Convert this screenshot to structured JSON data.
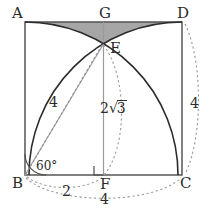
{
  "figure": {
    "type": "geometry-diagram",
    "colors": {
      "stroke": "#2b2b2b",
      "light_stroke": "#8c8c8c",
      "dotted": "#9a9a9a",
      "shade_fill": "#9e9e9e",
      "background": "#ffffff"
    },
    "square": {
      "vertices": [
        {
          "name": "A",
          "label": "A",
          "x": 25,
          "y": 22,
          "label_x": 12,
          "label_y": 6
        },
        {
          "name": "D",
          "label": "D",
          "x": 182,
          "y": 22,
          "label_x": 177,
          "label_y": 6
        },
        {
          "name": "C",
          "label": "C",
          "x": 182,
          "y": 175,
          "label_x": 180,
          "label_y": 176
        },
        {
          "name": "B",
          "label": "B",
          "x": 25,
          "y": 175,
          "label_x": 12,
          "label_y": 176
        }
      ],
      "side_length": 4
    },
    "points": [
      {
        "name": "G",
        "label": "G",
        "x": 103.5,
        "y": 22,
        "label_x": 99,
        "label_y": 6,
        "role": "midpoint-of-AD"
      },
      {
        "name": "F",
        "label": "F",
        "x": 103.5,
        "y": 175,
        "label_x": 100,
        "label_y": 177,
        "role": "midpoint-of-BC"
      },
      {
        "name": "E",
        "label": "E",
        "x": 103.5,
        "y": 44,
        "label_x": 110,
        "label_y": 41,
        "role": "arc-intersection"
      }
    ],
    "measures": [
      {
        "name": "left-radius",
        "label": "4",
        "x": 49,
        "y": 95,
        "target": "BE-radius"
      },
      {
        "name": "right-side",
        "label": "4",
        "x": 190,
        "y": 96,
        "target": "DC-side"
      },
      {
        "name": "height-EF",
        "label": "2√3",
        "base": "2",
        "radicand": "3",
        "x": 100,
        "y": 100,
        "target": "EF-height"
      },
      {
        "name": "half-base",
        "label": "2",
        "x": 62,
        "y": 184,
        "target": "BF-segment"
      },
      {
        "name": "full-base",
        "label": "4",
        "x": 100,
        "y": 192,
        "target": "BC-segment"
      },
      {
        "name": "angle-EBF",
        "label": "60°",
        "x": 36,
        "y": 160,
        "target": "angle-at-B"
      }
    ],
    "arcs": [
      {
        "name": "arc-from-B",
        "center": "B",
        "radius": 4,
        "style": "solid",
        "from": "A",
        "to": "C-side"
      },
      {
        "name": "arc-from-C",
        "center": "C",
        "radius": 4,
        "style": "solid",
        "from": "D",
        "to": "B-side"
      },
      {
        "name": "dimension-arc-BF",
        "style": "dotted",
        "label": "2"
      },
      {
        "name": "dimension-arc-BC",
        "style": "dotted",
        "label": "4"
      },
      {
        "name": "dimension-arc-DC",
        "style": "dotted",
        "label": "4"
      },
      {
        "name": "dashed-arc-E-to-F",
        "style": "dotted"
      }
    ],
    "segments": [
      {
        "name": "segment-GF",
        "from": "G",
        "to": "F",
        "style": "solid-light"
      },
      {
        "name": "segment-BE-solid",
        "from": "B",
        "to": "E",
        "style": "solid-light"
      },
      {
        "name": "segment-BE-dotted",
        "from": "B",
        "to": "E",
        "style": "dotted"
      }
    ],
    "markers": [
      {
        "name": "right-angle-at-F",
        "x": 94,
        "y": 166,
        "size": 9
      }
    ],
    "shaded_region": {
      "name": "lens-region-AGD-E",
      "fill": "#9e9e9e",
      "description": "region bounded above by AD and below by the two arcs meeting at E"
    }
  }
}
